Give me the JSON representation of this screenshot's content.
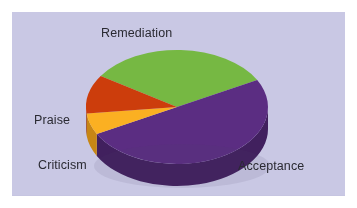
{
  "page": {
    "background_color": "#ffffff",
    "panel_background_color": "#c9c8e4"
  },
  "chart_data": {
    "type": "pie",
    "title": "",
    "subtitle": "",
    "xlabel": "",
    "ylabel": "",
    "legend_position": "none",
    "labels_position": "outside",
    "three_d": true,
    "categories": [
      "Acceptance",
      "Remediation",
      "Praise",
      "Criticism"
    ],
    "values": [
      50,
      33,
      11,
      6
    ],
    "slices": [
      {
        "label": "Acceptance",
        "value": 50,
        "color": "#5b2d82",
        "side_color": "#41205e"
      },
      {
        "label": "Remediation",
        "value": 33,
        "color": "#76b843",
        "side_color": "#568430"
      },
      {
        "label": "Praise",
        "value": 11,
        "color": "#cc3d0c",
        "side_color": "#922b08"
      },
      {
        "label": "Criticism",
        "value": 6,
        "color": "#fbb022",
        "side_color": "#c78615"
      }
    ],
    "colors": [
      "#5b2d82",
      "#76b843",
      "#cc3d0c",
      "#fbb022"
    ],
    "annotations": []
  },
  "labels": {
    "remediation": "Remediation",
    "praise": "Praise",
    "criticism": "Criticism",
    "acceptance": "Acceptance"
  }
}
